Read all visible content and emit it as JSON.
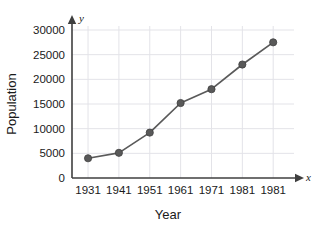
{
  "chart_data": {
    "type": "line",
    "title": "",
    "xlabel": "Year",
    "ylabel": "Population",
    "categories": [
      "1931",
      "1941",
      "1951",
      "1961",
      "1971",
      "1981",
      "1981"
    ],
    "values": [
      4000,
      5100,
      9200,
      15200,
      18000,
      23000,
      27500
    ],
    "series": [
      {
        "name": "Population",
        "values": [
          4000,
          5100,
          9200,
          15200,
          18000,
          23000,
          27500
        ]
      }
    ],
    "xtick_labels": [
      "1931",
      "1941",
      "1951",
      "1961",
      "1971",
      "1981",
      "1981"
    ],
    "ytick_labels": [
      "0",
      "5000",
      "10000",
      "15000",
      "20000",
      "25000",
      "30000"
    ],
    "ytick_values": [
      0,
      5000,
      10000,
      15000,
      20000,
      25000,
      30000
    ],
    "ylim": [
      0,
      31500
    ],
    "grid": true,
    "legend": "none",
    "x_axis_letter": "x",
    "y_axis_letter": "y",
    "marker": "filled-circle",
    "line_color": "#5a5a5a",
    "marker_color": "#595959",
    "grid_color": "#e3e3e8",
    "axis_color": "#3f3f3f",
    "background_color": "#ffffff"
  }
}
